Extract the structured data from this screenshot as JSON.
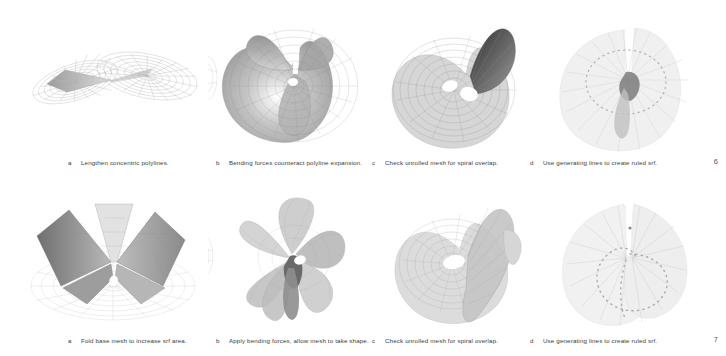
{
  "sheet": {
    "background": "#ffffff",
    "ink": "#3b3b3b",
    "mesh_light": "#c9c9c9",
    "mesh_mid": "#9a9a9a",
    "mesh_dark": "#4a4a4a"
  },
  "rows": [
    {
      "number": "6",
      "figures": [
        {
          "letter": "a",
          "caption": "Lengthen concentric polylines.",
          "name": "figure-saddle-concentric-polylines",
          "kind": "wireframe-saddle"
        },
        {
          "letter": "b",
          "caption": "Bending forces counteract polyline expansion.",
          "name": "figure-bending-forces-counteract",
          "kind": "shaded-conical-fold"
        },
        {
          "letter": "c",
          "caption": "Check unrolled mesh for spiral overlap.",
          "name": "figure-unrolled-spiral-overlap",
          "kind": "spiral-unrolled"
        },
        {
          "letter": "d",
          "caption": "Use generating lines to create ruled srf.",
          "name": "figure-generating-lines-ruled-srf",
          "kind": "radial-generating-lines"
        }
      ]
    },
    {
      "number": "7",
      "figures": [
        {
          "letter": "a",
          "caption": "Fold base mesh to increase srf area.",
          "name": "figure-fold-base-mesh",
          "kind": "folded-base-mesh"
        },
        {
          "letter": "b",
          "caption": "Apply bending forces, allow mesh to take shape.",
          "name": "figure-apply-bending-forces",
          "kind": "pinwheel-lobes"
        },
        {
          "letter": "c",
          "caption": "Check unrolled mesh for spiral overlap.",
          "name": "figure-unrolled-spiral-overlap-2",
          "kind": "spiral-unrolled-cone"
        },
        {
          "letter": "d",
          "caption": "Use generating lines to create ruled srf.",
          "name": "figure-generating-lines-ruled-srf-2",
          "kind": "radial-generating-lines-fan"
        }
      ]
    }
  ]
}
